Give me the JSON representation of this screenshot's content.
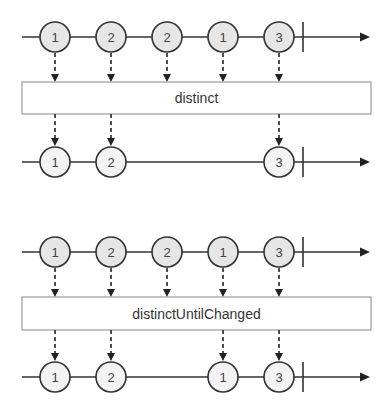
{
  "diagrams": [
    {
      "operator": "distinct",
      "input": {
        "y": 37,
        "marbles": [
          {
            "x": 55,
            "label": "1"
          },
          {
            "x": 111,
            "label": "2"
          },
          {
            "x": 167,
            "label": "2"
          },
          {
            "x": 223,
            "label": "1"
          },
          {
            "x": 279,
            "label": "3"
          }
        ]
      },
      "box": {
        "x": 22,
        "y": 82,
        "w": 349,
        "h": 32
      },
      "output": {
        "y": 162,
        "marbles": [
          {
            "x": 55,
            "label": "1"
          },
          {
            "x": 111,
            "label": "2"
          },
          {
            "x": 279,
            "label": "3"
          }
        ]
      }
    },
    {
      "operator": "distinctUntilChanged",
      "input": {
        "y": 252,
        "marbles": [
          {
            "x": 55,
            "label": "1"
          },
          {
            "x": 111,
            "label": "2"
          },
          {
            "x": 167,
            "label": "2"
          },
          {
            "x": 223,
            "label": "1"
          },
          {
            "x": 279,
            "label": "3"
          }
        ]
      },
      "box": {
        "x": 22,
        "y": 297,
        "w": 349,
        "h": 33
      },
      "output": {
        "y": 377,
        "marbles": [
          {
            "x": 55,
            "label": "1"
          },
          {
            "x": 111,
            "label": "2"
          },
          {
            "x": 223,
            "label": "1"
          },
          {
            "x": 279,
            "label": "3"
          }
        ]
      }
    }
  ],
  "timeline": {
    "start_x": 22,
    "end_x": 370,
    "complete_x": 303,
    "marble_radius": 15
  }
}
